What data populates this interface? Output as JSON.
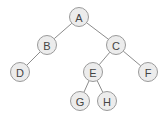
{
  "diagram": {
    "type": "binary-tree",
    "root": "A",
    "nodes": [
      {
        "id": "A",
        "label": "A"
      },
      {
        "id": "B",
        "label": "B"
      },
      {
        "id": "C",
        "label": "C"
      },
      {
        "id": "D",
        "label": "D"
      },
      {
        "id": "E",
        "label": "E"
      },
      {
        "id": "F",
        "label": "F"
      },
      {
        "id": "G",
        "label": "G"
      },
      {
        "id": "H",
        "label": "H"
      }
    ],
    "edges": [
      {
        "from": "A",
        "to": "B"
      },
      {
        "from": "A",
        "to": "C"
      },
      {
        "from": "B",
        "to": "D"
      },
      {
        "from": "C",
        "to": "E"
      },
      {
        "from": "C",
        "to": "F"
      },
      {
        "from": "E",
        "to": "G"
      },
      {
        "from": "E",
        "to": "H"
      }
    ],
    "colors": {
      "node_fill": "#ececec",
      "node_stroke": "#9a9a9a",
      "edge": "#8c8c8c",
      "label": "#444444"
    }
  }
}
